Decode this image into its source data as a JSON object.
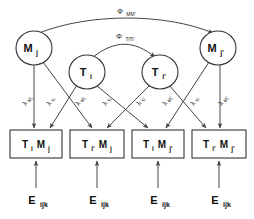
{
  "diagram": {
    "colors": {
      "stroke": "#333333",
      "path": "#444444",
      "background": "#ffffff",
      "text": "#111111"
    },
    "method_factors": [
      {
        "id": "Mj",
        "base": "M",
        "sub": "j",
        "cx": 34,
        "cy": 48,
        "rx": 18,
        "ry": 17
      },
      {
        "id": "Mjp",
        "base": "M",
        "sub": "j'",
        "cx": 218,
        "cy": 48,
        "rx": 18,
        "ry": 17
      }
    ],
    "trait_factors": [
      {
        "id": "Ti",
        "base": "T",
        "sub": "i",
        "cx": 87,
        "cy": 72,
        "rx": 18,
        "ry": 17
      },
      {
        "id": "Tip",
        "base": "T",
        "sub": "i'",
        "cx": 160,
        "cy": 72,
        "rx": 18,
        "ry": 17
      }
    ],
    "indicators": [
      {
        "id": "box1",
        "t_base": "T",
        "t_sub": "i",
        "m_base": "M",
        "m_sub": "j",
        "x": 10,
        "y": 130,
        "w": 52,
        "h": 28
      },
      {
        "id": "box2",
        "t_base": "T",
        "t_sub": "i'",
        "m_base": "M",
        "m_sub": "j",
        "x": 70,
        "y": 130,
        "w": 54,
        "h": 28
      },
      {
        "id": "box3",
        "t_base": "T",
        "t_sub": "i",
        "m_base": "M",
        "m_sub": "j'",
        "x": 132,
        "y": 130,
        "w": 52,
        "h": 28
      },
      {
        "id": "box4",
        "t_base": "T",
        "t_sub": "i'",
        "m_base": "M",
        "m_sub": "j'",
        "x": 192,
        "y": 130,
        "w": 54,
        "h": 28
      }
    ],
    "errors": [
      {
        "id": "e1",
        "base": "E",
        "sub": "ijk",
        "x": 36,
        "y": 200
      },
      {
        "id": "e2",
        "base": "E",
        "sub": "ijk",
        "x": 97,
        "y": 200
      },
      {
        "id": "e3",
        "base": "E",
        "sub": "ijk",
        "x": 158,
        "y": 200
      },
      {
        "id": "e4",
        "base": "E",
        "sub": "ijk",
        "x": 219,
        "y": 200
      }
    ],
    "loadings": [
      {
        "id": "l1",
        "base": "λ",
        "sub": "Mj",
        "x": 29,
        "y": 108,
        "rot": -62
      },
      {
        "id": "l2",
        "base": "λ",
        "sub": "Ti",
        "x": 52,
        "y": 108,
        "rot": -62
      },
      {
        "id": "l3",
        "base": "λ",
        "sub": "Mj",
        "x": 81,
        "y": 108,
        "rot": -62
      },
      {
        "id": "l4",
        "base": "λ",
        "sub": "Ti",
        "x": 108,
        "y": 108,
        "rot": -62
      },
      {
        "id": "l5",
        "base": "λ",
        "sub": "Ti'",
        "x": 142,
        "y": 108,
        "rot": -62
      },
      {
        "id": "l6",
        "base": "λ",
        "sub": "Mj'",
        "x": 168,
        "y": 108,
        "rot": -62
      },
      {
        "id": "l7",
        "base": "λ",
        "sub": "Ti'",
        "x": 196,
        "y": 108,
        "rot": -62
      },
      {
        "id": "l8",
        "base": "λ",
        "sub": "Mj'",
        "x": 224,
        "y": 108,
        "rot": -62
      }
    ],
    "correlations": [
      {
        "id": "phi_mm",
        "base": "Φ",
        "sub": "MM'",
        "label_x": 126,
        "label_y": 14
      },
      {
        "id": "phi_tt",
        "base": "Φ",
        "sub": "TiTi'",
        "label_x": 124,
        "label_y": 39
      }
    ]
  }
}
